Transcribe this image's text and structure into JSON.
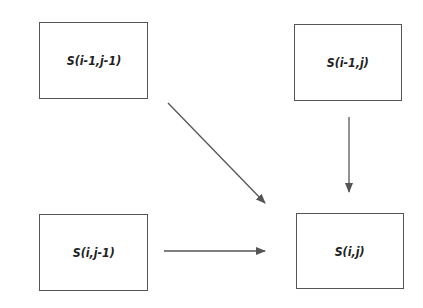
{
  "diagram": {
    "nodes": [
      {
        "id": "top-left",
        "label": "S(i-1,j-1)",
        "x": 39,
        "y": 22,
        "w": 109,
        "h": 77
      },
      {
        "id": "top-right",
        "label": "S(i-1,j)",
        "x": 294,
        "y": 24,
        "w": 108,
        "h": 77
      },
      {
        "id": "bottom-left",
        "label": "S(i,j-1)",
        "x": 39,
        "y": 214,
        "w": 109,
        "h": 77
      },
      {
        "id": "bottom-right",
        "label": "S(i,j)",
        "x": 296,
        "y": 213,
        "w": 108,
        "h": 76
      }
    ],
    "edges": [
      {
        "from": "S(i-1,j-1)",
        "to": "S(i,j)"
      },
      {
        "from": "S(i-1,j)",
        "to": "S(i,j)"
      },
      {
        "from": "S(i,j-1)",
        "to": "S(i,j)"
      }
    ],
    "colors": {
      "stroke": "#555555",
      "text": "#222222",
      "background": "#ffffff"
    }
  }
}
